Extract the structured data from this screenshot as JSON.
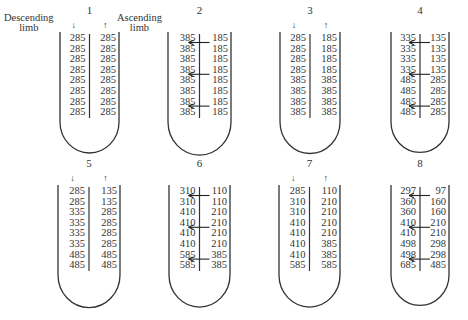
{
  "labels": {
    "descending": "Descending\nlimb",
    "descending_line1": "Descending",
    "descending_line2": "limb",
    "ascending_line1": "Ascending",
    "ascending_line2": "limb"
  },
  "icons": {
    "down_arrow": "↓",
    "up_arrow": "↑"
  },
  "stages": [
    {
      "id": "1",
      "x": 60,
      "y": 32,
      "w": 59,
      "flow_arrows": true,
      "shift_arrows": [],
      "descending": [
        "285",
        "285",
        "285",
        "285",
        "285",
        "285",
        "285",
        "285"
      ],
      "ascending": [
        "285",
        "285",
        "285",
        "285",
        "285",
        "285",
        "285",
        "285"
      ]
    },
    {
      "id": "2",
      "x": 168,
      "y": 32,
      "w": 63,
      "flow_arrows": false,
      "shift_arrows": [
        0,
        3,
        6
      ],
      "descending": [
        "385",
        "385",
        "385",
        "385",
        "385",
        "385",
        "385",
        "385"
      ],
      "ascending": [
        "185",
        "185",
        "185",
        "185",
        "185",
        "185",
        "185",
        "185"
      ]
    },
    {
      "id": "3",
      "x": 280,
      "y": 32,
      "w": 60,
      "flow_arrows": true,
      "shift_arrows": [],
      "descending": [
        "285",
        "285",
        "285",
        "285",
        "385",
        "385",
        "385",
        "385"
      ],
      "ascending": [
        "185",
        "185",
        "185",
        "185",
        "385",
        "385",
        "385",
        "385"
      ]
    },
    {
      "id": "4",
      "x": 391,
      "y": 32,
      "w": 58,
      "flow_arrows": false,
      "shift_arrows": [
        0,
        3,
        6
      ],
      "descending": [
        "335",
        "335",
        "335",
        "335",
        "485",
        "485",
        "485",
        "485"
      ],
      "ascending": [
        "135",
        "135",
        "135",
        "135",
        "285",
        "285",
        "285",
        "285"
      ]
    },
    {
      "id": "5",
      "x": 58,
      "y": 185,
      "w": 62,
      "flow_arrows": true,
      "shift_arrows": [],
      "descending": [
        "285",
        "285",
        "335",
        "335",
        "335",
        "335",
        "485",
        "485"
      ],
      "ascending": [
        "135",
        "135",
        "285",
        "285",
        "285",
        "285",
        "485",
        "485"
      ]
    },
    {
      "id": "6",
      "x": 169,
      "y": 185,
      "w": 61,
      "flow_arrows": false,
      "shift_arrows": [
        0,
        3,
        6
      ],
      "descending": [
        "310",
        "310",
        "410",
        "410",
        "410",
        "410",
        "585",
        "585"
      ],
      "ascending": [
        "110",
        "110",
        "210",
        "210",
        "210",
        "210",
        "385",
        "385"
      ]
    },
    {
      "id": "7",
      "x": 279,
      "y": 185,
      "w": 61,
      "flow_arrows": true,
      "shift_arrows": [],
      "descending": [
        "285",
        "310",
        "310",
        "410",
        "410",
        "410",
        "410",
        "585"
      ],
      "ascending": [
        "110",
        "210",
        "210",
        "210",
        "210",
        "385",
        "385",
        "585"
      ]
    },
    {
      "id": "8",
      "x": 391,
      "y": 185,
      "w": 58,
      "flow_arrows": false,
      "shift_arrows": [
        0,
        3,
        6
      ],
      "descending": [
        "297",
        "360",
        "360",
        "410",
        "410",
        "498",
        "498",
        "685"
      ],
      "ascending": [
        "97",
        "160",
        "160",
        "210",
        "210",
        "298",
        "298",
        "485"
      ]
    }
  ],
  "colors": {
    "ink": "#333333",
    "background": "#ffffff"
  }
}
